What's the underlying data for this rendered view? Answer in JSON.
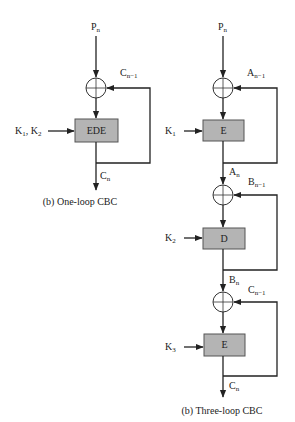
{
  "diagrams": [
    {
      "id": "one-loop",
      "caption": "(b) One-loop CBC",
      "input": {
        "base": "P",
        "sub": "n"
      },
      "feedback_label": {
        "base": "C",
        "sub": "n−1"
      },
      "stages": [
        {
          "block": "EDE",
          "key": {
            "base": "K",
            "sub": "1",
            "tail": ", K",
            "sub2": "2"
          },
          "output": {
            "base": "C",
            "sub": "n"
          }
        }
      ]
    },
    {
      "id": "three-loop",
      "caption": "(b) Three-loop CBC",
      "input": {
        "base": "P",
        "sub": "n"
      },
      "stages": [
        {
          "block": "E",
          "key": {
            "base": "K",
            "sub": "1"
          },
          "feedback_label": {
            "base": "A",
            "sub": "n−1"
          },
          "output": {
            "base": "A",
            "sub": "n"
          }
        },
        {
          "block": "D",
          "key": {
            "base": "K",
            "sub": "2"
          },
          "feedback_label": {
            "base": "B",
            "sub": "n−1"
          },
          "output": {
            "base": "B",
            "sub": "n"
          }
        },
        {
          "block": "E",
          "key": {
            "base": "K",
            "sub": "3"
          },
          "feedback_label": {
            "base": "C",
            "sub": "n−1"
          },
          "output": {
            "base": "C",
            "sub": "n"
          }
        }
      ]
    }
  ],
  "colors": {
    "block_fill": "#b4b4b4",
    "line": "#222222"
  }
}
